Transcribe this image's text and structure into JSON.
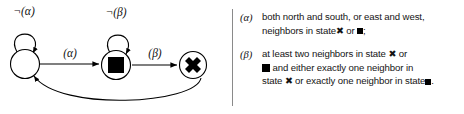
{
  "figure": {
    "kind": "finite-state-automaton-with-legend",
    "width": 464,
    "height": 114,
    "background": "#ffffff",
    "line_color": "#000000",
    "divider_color": "#8a8a8a"
  },
  "diagram": {
    "states": [
      {
        "id": "s0",
        "label": "",
        "marker": "empty-circle",
        "cx": 25,
        "cy": 63,
        "r": 14
      },
      {
        "id": "s1",
        "label": "■",
        "marker": "filled-square",
        "cx": 117,
        "cy": 65,
        "r": 14
      },
      {
        "id": "s2",
        "label": "✖",
        "marker": "bold-x",
        "cx": 194,
        "cy": 65,
        "r": 13
      }
    ],
    "transitions": [
      {
        "from": "s0",
        "to": "s0",
        "label": "¬(α)",
        "kind": "self-loop-above"
      },
      {
        "from": "s1",
        "to": "s1",
        "label": "¬(β)",
        "kind": "self-loop-above"
      },
      {
        "from": "s0",
        "to": "s1",
        "label": "(α)",
        "kind": "straight-right"
      },
      {
        "from": "s1",
        "to": "s2",
        "label": "(β)",
        "kind": "straight-right"
      },
      {
        "from": "s2",
        "to": "s0",
        "label": "",
        "kind": "curve-below"
      }
    ],
    "labels": {
      "not_alpha": "¬(α)",
      "not_beta": "¬(β)",
      "alpha": "(α)",
      "beta": "(β)"
    }
  },
  "legend": {
    "items": [
      {
        "tag": "(α)",
        "lines": [
          [
            {
              "t": "text",
              "v": "both north and south, or east and west,"
            }
          ],
          [
            {
              "t": "text",
              "v": "neighbors in state"
            },
            {
              "t": "glyph-x"
            },
            {
              "t": "text",
              "v": " or "
            },
            {
              "t": "glyph-square"
            },
            {
              "t": "text",
              "v": ";"
            }
          ]
        ]
      },
      {
        "tag": "(β)",
        "lines": [
          [
            {
              "t": "text",
              "v": "at least two neighbors in state "
            },
            {
              "t": "glyph-x"
            },
            {
              "t": "text",
              "v": " or"
            }
          ],
          [
            {
              "t": "glyph-square-big"
            },
            {
              "t": "text",
              "v": " and either exactly one neighbor in"
            }
          ],
          [
            {
              "t": "text",
              "v": "state "
            },
            {
              "t": "glyph-x"
            },
            {
              "t": "text",
              "v": " or exactly one neighbor in state"
            },
            {
              "t": "glyph-square"
            },
            {
              "t": "text",
              "v": "."
            }
          ]
        ]
      }
    ],
    "plain_text": {
      "alpha": "(α) both north and south, or east and west, neighbors in state ✖ or ▪;",
      "beta": "(β) at least two neighbors in state ✖ or ■ and either exactly one neighbor in state ✖ or exactly one neighbor in state ▪."
    }
  }
}
